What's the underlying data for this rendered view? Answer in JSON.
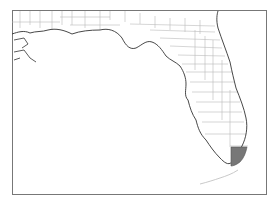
{
  "map": {
    "title": "",
    "region": "Florida",
    "highlighted_county": "Miami-Dade",
    "colors": {
      "frame": "#777777",
      "coast": "#333333",
      "county_border": "#bbbbbb",
      "highlight": "#777777",
      "land": "#ffffff",
      "water": "#ffffff"
    }
  }
}
